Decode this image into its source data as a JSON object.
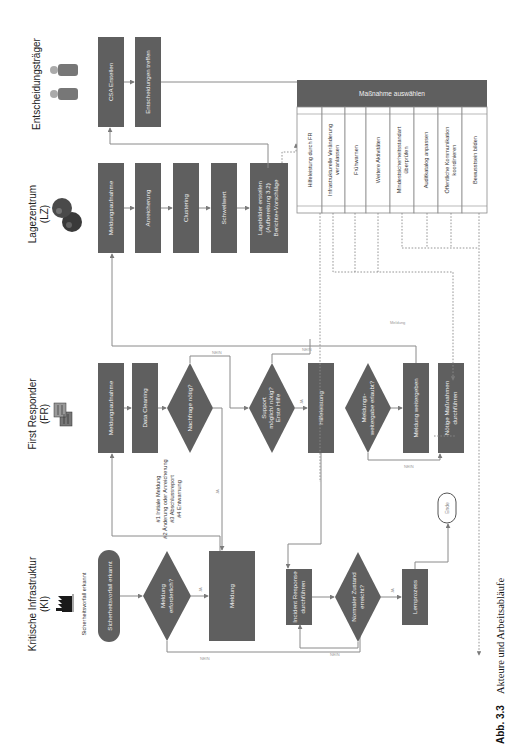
{
  "lanes": [
    {
      "title": "Kritische Infrastruktur",
      "subtitle": "(KI)",
      "icon": "factory-icon"
    },
    {
      "title": "First Responder",
      "subtitle": "(FR)",
      "icon": "buildings-icon"
    },
    {
      "title": "Lagezentrum",
      "subtitle": "(LZ)",
      "icon": "globe-icon"
    },
    {
      "title": "Entscheidungsträger",
      "subtitle": "",
      "icon": "people-icon"
    }
  ],
  "nodes": {
    "start": "Sicherheitsvorfall erkannt",
    "ki_decision_meldung": [
      "Meldung",
      "erforderlich?"
    ],
    "ki_meldung": "Meldung",
    "ki_incident": [
      "Incident Response",
      "durchführen"
    ],
    "ki_decision_normal": [
      "Normaler Zustand",
      "erreicht?"
    ],
    "ki_lernprozess": "Lernprozess",
    "fr_meldungsaufnahme": "Meldungsaufnahme",
    "fr_data_cleaning": "Data Cleaning",
    "fr_decision_nachfrage": "Nachfrage nötig?",
    "fr_decision_support": [
      "Support",
      "möglich/ nötig?",
      "Erste Hilfe"
    ],
    "fr_hilfeleistung": "Hilfeleistung",
    "fr_decision_weitergabe": [
      "Meldungs-",
      "weitergabe erlaubt?"
    ],
    "fr_meldung_weitergeben": "Meldung weitergeben",
    "fr_noetige_massnahmen": [
      "Nötige Maßnahmen",
      "durchführen"
    ],
    "lz_meldungsaufnahme": "Meldungsaufnahme",
    "lz_anreicherung": "Anreicherung",
    "lz_clustering": "Clustering",
    "lz_schwellwert": "Schwellwert",
    "lz_lagebilder": [
      "Lagebilder erstellen",
      "(Aufbereitung 3.2)",
      "Berichte+Vorschläge"
    ],
    "et_csa": "CSA Erstellen",
    "et_entscheidungen": "Entscheidungen treffen",
    "end": "Ende"
  },
  "massnahme_table": {
    "header": "Maßnahme auswählen",
    "items": [
      [
        "Hilfeleistung durch FR"
      ],
      [
        "Infrastrukturelle Veränderung",
        "veranlassen"
      ],
      [
        "Frühwarnen"
      ],
      [
        "Weitere Aktivitäten"
      ],
      [
        "Mindestsicherheitsstandart",
        "überprüfen"
      ],
      [
        "Auditkatalog anpassen"
      ],
      [
        "Öffentliche Kommunikation",
        "koordinieren"
      ],
      [
        "Bewusstsein bilden"
      ]
    ]
  },
  "report_types": [
    "#1 Initiale Meldung",
    "#2 Änderung oder Anreicherung",
    "#3 Abschlussreport",
    "#4 Entwarnung"
  ],
  "edge_labels": {
    "yes": "JA",
    "no": "NEIN",
    "meldung": "Meldung"
  },
  "caption": {
    "label": "Abb. 3.3",
    "text": "Akteure und Arbeitsabläufe"
  },
  "colors": {
    "box_fill": "#5f5f5f",
    "box_text": "#f2f2f2",
    "line": "#8a8a8a"
  }
}
